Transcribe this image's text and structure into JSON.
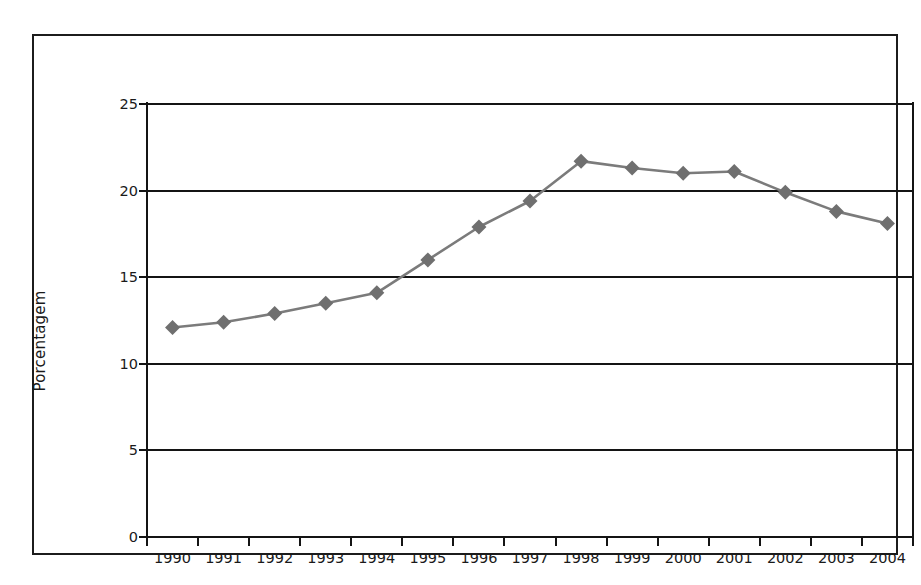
{
  "chart_data": {
    "type": "line",
    "title": "",
    "xlabel": "",
    "ylabel": "Porcentagem",
    "categories": [
      "1990",
      "1991",
      "1992",
      "1993",
      "1994",
      "1995",
      "1996",
      "1997",
      "1998",
      "1999",
      "2000",
      "2001",
      "2002",
      "2003",
      "2004"
    ],
    "values": [
      12.1,
      12.4,
      12.9,
      13.5,
      14.1,
      16.0,
      17.9,
      19.4,
      21.7,
      21.3,
      21.0,
      21.1,
      19.9,
      18.8,
      18.1
    ],
    "series": [
      {
        "name": "Porcentagem",
        "values": [
          12.1,
          12.4,
          12.9,
          13.5,
          14.1,
          16.0,
          17.9,
          19.4,
          21.7,
          21.3,
          21.0,
          21.1,
          19.9,
          18.8,
          18.1
        ]
      }
    ],
    "ylim": [
      0,
      25
    ],
    "yticks": [
      0,
      5,
      10,
      15,
      20,
      25
    ],
    "ytick_labels": [
      "0",
      "5",
      "10",
      "15",
      "20",
      "25"
    ],
    "grid": "horizontal",
    "legend": "none",
    "marker": "diamond",
    "colors": {
      "line": "#7b7b7b",
      "marker": "#6f6f6f",
      "axis": "#141414",
      "grid": "#141414",
      "text": "#1a1a1a",
      "frame": "#1c1c1c",
      "background": "#ffffff"
    }
  }
}
